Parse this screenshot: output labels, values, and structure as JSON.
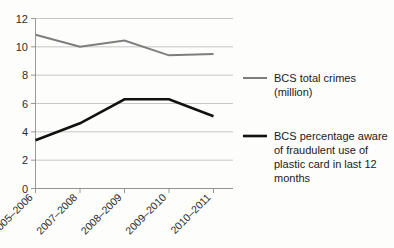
{
  "chart_data": {
    "type": "line",
    "title": "",
    "subtitle": "",
    "xlabel": "",
    "ylabel": "",
    "categories": [
      "2005–2006",
      "2007–2008",
      "2008–2009",
      "2009–2010",
      "2010–2011"
    ],
    "ylim": [
      0,
      12
    ],
    "yticks": [
      0,
      2,
      4,
      6,
      8,
      10,
      12
    ],
    "ytick_labels": [
      "0",
      "2",
      "4",
      "6",
      "8",
      "10",
      "12"
    ],
    "grid": "horizontal",
    "legend_position": "right",
    "series": [
      {
        "name": "BCS total crimes (million)",
        "legend_lines": [
          "BCS total crimes",
          "(million)"
        ],
        "color": "#7d7d7d",
        "line_width": 2.0,
        "values": [
          10.85,
          10.0,
          10.45,
          9.4,
          9.5
        ]
      },
      {
        "name": "BCS percentage aware of fraudulent use of plastic card in last 12 months",
        "legend_lines": [
          "BCS percentage aware",
          "of fraudulent use of",
          "plastic card in last 12",
          "months"
        ],
        "color": "#111111",
        "line_width": 2.6,
        "values": [
          3.4,
          4.6,
          6.3,
          6.3,
          5.1
        ]
      }
    ]
  },
  "colors": {
    "background": "#fdfdfc",
    "grid": "#b9b9b9",
    "axis": "#8d8d8d",
    "series_gray": "#7d7d7d",
    "series_black": "#111111",
    "text": "#1b1b1b"
  }
}
